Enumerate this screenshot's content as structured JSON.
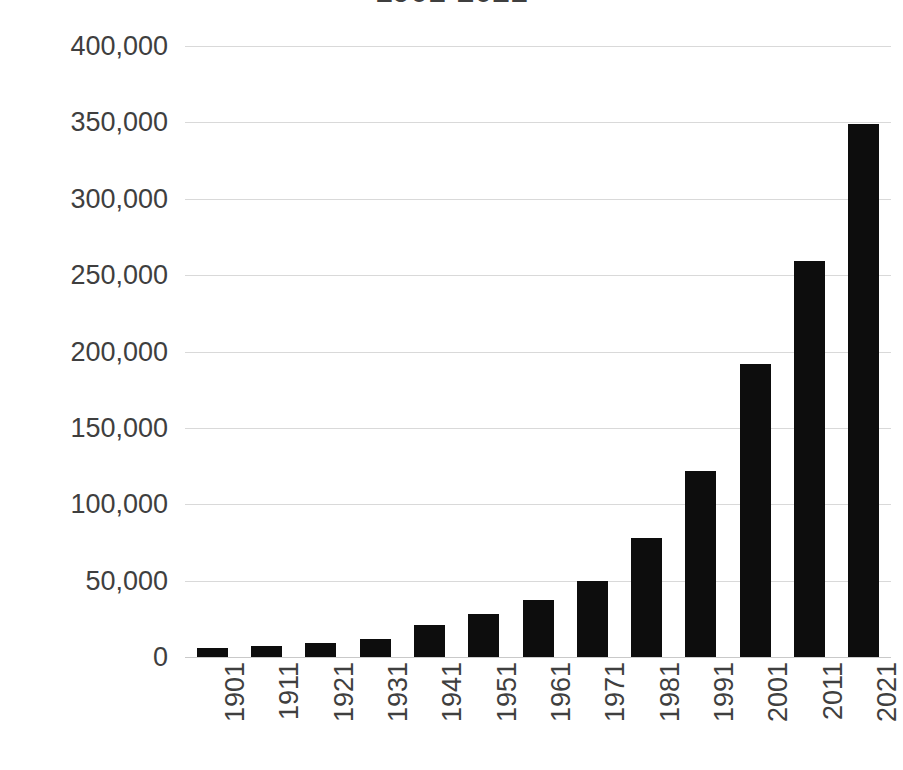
{
  "chart_data": {
    "type": "bar",
    "title": "1901-2021",
    "subtitle": "",
    "xlabel": "",
    "ylabel": "",
    "categories": [
      "1901",
      "1911",
      "1921",
      "1931",
      "1941",
      "1951",
      "1961",
      "1971",
      "1981",
      "1991",
      "2001",
      "2011",
      "2021"
    ],
    "values": [
      6000,
      7500,
      9500,
      12000,
      21000,
      28000,
      37500,
      50000,
      78000,
      122000,
      192000,
      259000,
      349000
    ],
    "series": [
      {
        "name": "Population",
        "values": [
          6000,
          7500,
          9500,
          12000,
          21000,
          28000,
          37500,
          50000,
          78000,
          122000,
          192000,
          259000,
          349000
        ]
      }
    ],
    "ylim": [
      0,
      400000
    ],
    "ytick_values": [
      0,
      50000,
      100000,
      150000,
      200000,
      250000,
      300000,
      350000,
      400000
    ],
    "ytick_labels": [
      "0",
      "50,000",
      "100,000",
      "150,000",
      "200,000",
      "250,000",
      "300,000",
      "350,000",
      "400,000"
    ],
    "grid": true,
    "grid_axis": "y",
    "legend": false,
    "legend_position": "none",
    "bar_color": "#0D0D0D",
    "grid_color": "#D9D9D9",
    "text_color": "#3F3F3F",
    "background_color": "#FFFFFF",
    "xtick_rotation": -90
  },
  "axes": {
    "y_axis_name": "y-axis",
    "x_axis_name": "x-axis"
  }
}
